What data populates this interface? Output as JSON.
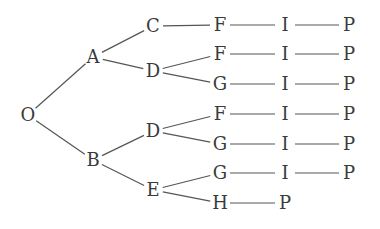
{
  "diagram": {
    "type": "tree",
    "nodes": [
      {
        "id": "O",
        "label": "O",
        "x": 28,
        "y": 115
      },
      {
        "id": "A",
        "label": "A",
        "x": 93,
        "y": 57
      },
      {
        "id": "B",
        "label": "B",
        "x": 93,
        "y": 160
      },
      {
        "id": "C",
        "label": "C",
        "x": 153,
        "y": 26
      },
      {
        "id": "D1",
        "label": "D",
        "x": 153,
        "y": 71
      },
      {
        "id": "D2",
        "label": "D",
        "x": 153,
        "y": 131
      },
      {
        "id": "E",
        "label": "E",
        "x": 153,
        "y": 190
      },
      {
        "id": "F1",
        "label": "F",
        "x": 220,
        "y": 25
      },
      {
        "id": "F2",
        "label": "F",
        "x": 220,
        "y": 54
      },
      {
        "id": "G1",
        "label": "G",
        "x": 220,
        "y": 84
      },
      {
        "id": "F3",
        "label": "F",
        "x": 220,
        "y": 114
      },
      {
        "id": "G2",
        "label": "G",
        "x": 220,
        "y": 144
      },
      {
        "id": "G3",
        "label": "G",
        "x": 220,
        "y": 173
      },
      {
        "id": "H",
        "label": "H",
        "x": 220,
        "y": 203
      },
      {
        "id": "I1",
        "label": "I",
        "x": 285,
        "y": 25
      },
      {
        "id": "I2",
        "label": "I",
        "x": 285,
        "y": 54
      },
      {
        "id": "I3",
        "label": "I",
        "x": 285,
        "y": 84
      },
      {
        "id": "I4",
        "label": "I",
        "x": 285,
        "y": 114
      },
      {
        "id": "I5",
        "label": "I",
        "x": 285,
        "y": 144
      },
      {
        "id": "I6",
        "label": "I",
        "x": 285,
        "y": 173
      },
      {
        "id": "P7",
        "label": "P",
        "x": 285,
        "y": 203
      },
      {
        "id": "P1",
        "label": "P",
        "x": 349,
        "y": 25
      },
      {
        "id": "P2",
        "label": "P",
        "x": 349,
        "y": 54
      },
      {
        "id": "P3",
        "label": "P",
        "x": 349,
        "y": 84
      },
      {
        "id": "P4",
        "label": "P",
        "x": 349,
        "y": 114
      },
      {
        "id": "P5",
        "label": "P",
        "x": 349,
        "y": 144
      },
      {
        "id": "P6",
        "label": "P",
        "x": 349,
        "y": 173
      }
    ],
    "edges": [
      [
        "O",
        "A"
      ],
      [
        "O",
        "B"
      ],
      [
        "A",
        "C"
      ],
      [
        "A",
        "D1"
      ],
      [
        "B",
        "D2"
      ],
      [
        "B",
        "E"
      ],
      [
        "C",
        "F1"
      ],
      [
        "D1",
        "F2"
      ],
      [
        "D1",
        "G1"
      ],
      [
        "D2",
        "F3"
      ],
      [
        "D2",
        "G2"
      ],
      [
        "E",
        "G3"
      ],
      [
        "E",
        "H"
      ],
      [
        "F1",
        "I1"
      ],
      [
        "F2",
        "I2"
      ],
      [
        "G1",
        "I3"
      ],
      [
        "F3",
        "I4"
      ],
      [
        "G2",
        "I5"
      ],
      [
        "G3",
        "I6"
      ],
      [
        "H",
        "P7"
      ],
      [
        "I1",
        "P1"
      ],
      [
        "I2",
        "P2"
      ],
      [
        "I3",
        "P3"
      ],
      [
        "I4",
        "P4"
      ],
      [
        "I5",
        "P5"
      ],
      [
        "I6",
        "P6"
      ]
    ],
    "paths": [
      "O-A-C-F-I-P",
      "O-A-D-F-I-P",
      "O-A-D-G-I-P",
      "O-B-D-F-I-P",
      "O-B-D-G-I-P",
      "O-B-E-G-I-P",
      "O-B-E-H-P"
    ]
  }
}
